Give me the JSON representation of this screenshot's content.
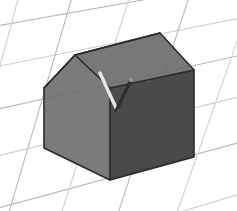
{
  "scene": {
    "title": "3D house model on perspective grid",
    "canvas": {
      "width": 237,
      "height": 211
    },
    "background_color": "#ffffff",
    "grid": {
      "name": "perspective-floor-grid",
      "line_color": "#b9b9b9",
      "line_color_light": "#cfcfcf",
      "line_width": 1.1,
      "description": "Receding checker grid plane seen in perspective",
      "lines_direction_a": [
        {
          "x1": -60,
          "y1": 36,
          "x2": 300,
          "y2": -28
        },
        {
          "x1": -60,
          "y1": 78,
          "x2": 300,
          "y2": 6
        },
        {
          "x1": -60,
          "y1": 122,
          "x2": 300,
          "y2": 42
        },
        {
          "x1": -60,
          "y1": 170,
          "x2": 300,
          "y2": 82
        },
        {
          "x1": -60,
          "y1": 224,
          "x2": 300,
          "y2": 126
        },
        {
          "x1": -60,
          "y1": 284,
          "x2": 300,
          "y2": 176
        }
      ],
      "lines_direction_b": [
        {
          "x1": -26,
          "y1": -30,
          "x2": -96,
          "y2": 250
        },
        {
          "x1": 26,
          "y1": -30,
          "x2": -50,
          "y2": 250
        },
        {
          "x1": 80,
          "y1": -30,
          "x2": -2,
          "y2": 250
        },
        {
          "x1": 138,
          "y1": -30,
          "x2": 50,
          "y2": 250
        },
        {
          "x1": 198,
          "y1": -30,
          "x2": 106,
          "y2": 250
        },
        {
          "x1": 262,
          "y1": -30,
          "x2": 164,
          "y2": 250
        },
        {
          "x1": 330,
          "y1": -30,
          "x2": 226,
          "y2": 250
        }
      ]
    },
    "house": {
      "name": "house-model",
      "edge_color": "#2a2a2a",
      "edge_width": 1.6,
      "faces": [
        {
          "name": "gable-front-face",
          "label": "Front gable wall",
          "fill": "#6d6d6d",
          "opacity": 0.9,
          "points": "44,88 75,55 110,88 110,180 44,148"
        },
        {
          "name": "roof-face",
          "label": "Roof slope",
          "fill": "#696969",
          "opacity": 0.9,
          "points": "75,55 160,33 194,70 110,88"
        },
        {
          "name": "right-side-wall-face",
          "label": "Right side wall",
          "fill": "#3b3b3b",
          "opacity": 0.92,
          "points": "110,88 194,70 194,157 110,180"
        }
      ],
      "outline": "44,88 75,55 160,33 194,70 194,157 110,180 44,148",
      "interior_edges": [
        {
          "name": "ridge-edge",
          "x1": 75,
          "y1": 55,
          "x2": 160,
          "y2": 33
        },
        {
          "name": "eave-edge",
          "x1": 110,
          "y1": 88,
          "x2": 194,
          "y2": 70
        },
        {
          "name": "corner-vertical-edge",
          "x1": 110,
          "y1": 88,
          "x2": 110,
          "y2": 180
        },
        {
          "name": "gable-apex-edge",
          "x1": 75,
          "y1": 55,
          "x2": 110,
          "y2": 88
        },
        {
          "name": "gable-left-eave-edge",
          "x1": 44,
          "y1": 88,
          "x2": 75,
          "y2": 55
        }
      ]
    },
    "roof_details": {
      "name": "roof-rods",
      "rods": [
        {
          "name": "light-rod",
          "label": "Light antenna rod",
          "color": "#e8e6e0",
          "width": 3.4,
          "x1": 100,
          "y1": 73,
          "x2": 117,
          "y2": 110
        },
        {
          "name": "dark-rod",
          "label": "Dark antenna rod",
          "color": "#2f2f2f",
          "width": 3.4,
          "x1": 131,
          "y1": 80,
          "x2": 116,
          "y2": 111
        }
      ],
      "rod_tip": {
        "name": "rod-tip-highlight",
        "cx": 131,
        "cy": 80,
        "r": 2.1,
        "color": "#9a9a9a"
      }
    },
    "shading": {
      "roof_texture_lines": [
        {
          "x1": 96,
          "y1": 62,
          "x2": 150,
          "y2": 82
        },
        {
          "x1": 128,
          "y1": 48,
          "x2": 176,
          "y2": 74
        },
        {
          "x1": 84,
          "y1": 70,
          "x2": 104,
          "y2": 86
        }
      ],
      "texture_color": "#7d7d7d"
    }
  }
}
